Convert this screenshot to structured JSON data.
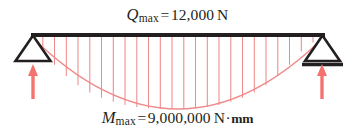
{
  "figure": {
    "title_top": "Q_max = 12,000 N",
    "title_bottom": "M_max = 9,000,000 N·mm",
    "shear": {
      "symbol": "Q",
      "subscript": "max",
      "equals": "=",
      "value": "12,000",
      "unit": "N"
    },
    "moment": {
      "symbol": "M",
      "subscript": "max",
      "equals": "=",
      "value": "9,000,000",
      "unit_force": "N",
      "unit_sep": "·",
      "unit_length": "mm"
    },
    "colors": {
      "beam": "#231f20",
      "support": "#231f20",
      "load_diagram": "#ef8a8a",
      "reaction_arrow": "#f4736f",
      "text": "#231f20",
      "background": "#ffffff"
    },
    "geometry": {
      "beam_left_x": 31,
      "beam_right_x": 325,
      "beam_y": 35,
      "beam_thickness": 4,
      "parabola_depth": 62,
      "hatch_count": 25,
      "support_half_width": 18,
      "support_height": 26
    },
    "parts": {
      "beam": "beam",
      "left_support": "pin-support",
      "right_support": "roller-support",
      "ground_line": "roller-ground-line",
      "left_reaction": "left-reaction-arrow",
      "right_reaction": "right-reaction-arrow",
      "moment_curve": "parabolic-moment-diagram",
      "hatching": "moment-diagram-hatching"
    }
  }
}
